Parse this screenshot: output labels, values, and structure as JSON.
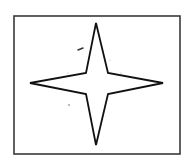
{
  "figure": {
    "canvas": {
      "width": 185,
      "height": 167,
      "background": "#ffffff"
    },
    "frame": {
      "x": 14,
      "y": 16,
      "width": 166,
      "height": 138,
      "stroke": "#3a3a3a",
      "stroke_width": 1.6
    },
    "star": {
      "points": [
        [
          96,
          23
        ],
        [
          108,
          73
        ],
        [
          163,
          83
        ],
        [
          108,
          94
        ],
        [
          96,
          145
        ],
        [
          86,
          94
        ],
        [
          30,
          83
        ],
        [
          86,
          73
        ]
      ],
      "stroke": "#111111",
      "stroke_width": 1.8,
      "fill": "#ffffff"
    },
    "stray_marks": [
      {
        "type": "dash",
        "x1": 78,
        "y1": 50,
        "x2": 83,
        "y2": 48,
        "stroke": "#333333",
        "stroke_width": 1.4
      },
      {
        "type": "dot",
        "cx": 69,
        "cy": 105,
        "r": 0.8,
        "fill": "#666666"
      },
      {
        "type": "dot",
        "cx": 68,
        "cy": 73,
        "r": 0.5,
        "fill": "#999999"
      },
      {
        "type": "dot",
        "cx": 121,
        "cy": 73,
        "r": 0.5,
        "fill": "#999999"
      },
      {
        "type": "dot",
        "cx": 110,
        "cy": 60,
        "r": 0.5,
        "fill": "#aaaaaa"
      }
    ]
  }
}
